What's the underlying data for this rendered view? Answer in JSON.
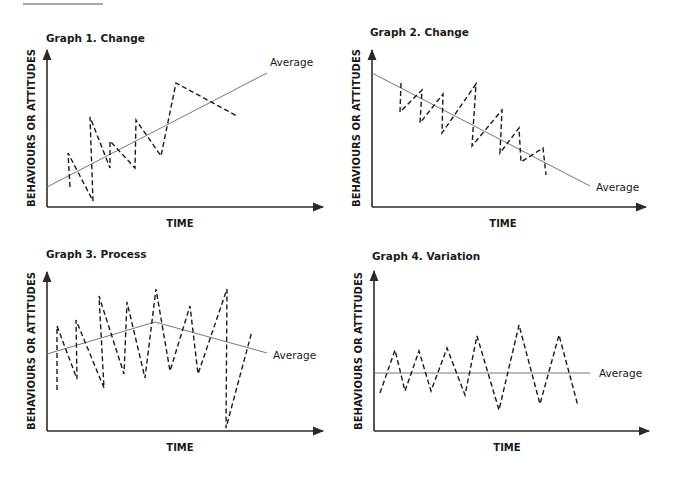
{
  "page": {
    "top_rule": {
      "x1": 23,
      "x2": 103,
      "y": 4
    }
  },
  "common": {
    "y_axis_label": "BEHAVIOURS OR ATTITUDES",
    "x_axis_label": "TIME",
    "average_label": "Average",
    "colors": {
      "axis": "#2a2a2a",
      "average_line": "#777777",
      "data_line": "#1a1a1a"
    }
  },
  "graphs": [
    {
      "title": "Graph 1. Change",
      "title_pos": [
        46,
        42
      ],
      "origin": [
        47,
        207
      ],
      "y_top": 50,
      "x_end": 323,
      "ylabel_pos": [
        35,
        128
      ],
      "xlabel_pos": [
        180,
        227
      ],
      "average_label_pos": [
        270,
        66
      ],
      "average": [
        [
          47,
          187
        ],
        [
          267,
          73
        ]
      ],
      "data": [
        [
          70,
          187
        ],
        [
          68,
          153
        ],
        [
          93,
          201
        ],
        [
          90,
          117
        ],
        [
          110,
          168
        ],
        [
          110,
          141
        ],
        [
          135,
          168
        ],
        [
          136,
          120
        ],
        [
          161,
          156
        ],
        [
          176,
          83
        ],
        [
          237,
          116
        ]
      ]
    },
    {
      "title": "Graph 2. Change",
      "title_pos": [
        370,
        36
      ],
      "origin": [
        372,
        207
      ],
      "y_top": 50,
      "x_end": 646,
      "ylabel_pos": [
        360,
        128
      ],
      "xlabel_pos": [
        503,
        227
      ],
      "average_label_pos": [
        596,
        191
      ],
      "average": [
        [
          372,
          73
        ],
        [
          590,
          186
        ]
      ],
      "data": [
        [
          401,
          83
        ],
        [
          400,
          112
        ],
        [
          422,
          90
        ],
        [
          420,
          123
        ],
        [
          443,
          94
        ],
        [
          442,
          133
        ],
        [
          476,
          84
        ],
        [
          472,
          146
        ],
        [
          502,
          110
        ],
        [
          500,
          153
        ],
        [
          519,
          128
        ],
        [
          521,
          162
        ],
        [
          543,
          148
        ],
        [
          546,
          175
        ]
      ]
    },
    {
      "title": "Graph 3. Process",
      "title_pos": [
        46,
        258
      ],
      "origin": [
        47,
        431
      ],
      "y_top": 272,
      "x_end": 323,
      "ylabel_pos": [
        35,
        351
      ],
      "xlabel_pos": [
        180,
        451
      ],
      "average_label_pos": [
        273,
        359
      ],
      "average": [
        [
          47,
          354
        ],
        [
          155,
          322
        ],
        [
          267,
          353
        ]
      ],
      "data": [
        [
          57,
          390
        ],
        [
          57,
          326
        ],
        [
          77,
          379
        ],
        [
          76,
          320
        ],
        [
          104,
          388
        ],
        [
          99,
          296
        ],
        [
          124,
          374
        ],
        [
          127,
          302
        ],
        [
          145,
          378
        ],
        [
          156,
          289
        ],
        [
          170,
          371
        ],
        [
          190,
          306
        ],
        [
          198,
          374
        ],
        [
          227,
          289
        ],
        [
          226,
          428
        ],
        [
          252,
          331
        ]
      ]
    },
    {
      "title": "Graph 4. Variation",
      "title_pos": [
        372,
        260
      ],
      "origin": [
        374,
        431
      ],
      "y_top": 271,
      "x_end": 649,
      "ylabel_pos": [
        362,
        351
      ],
      "xlabel_pos": [
        507,
        451
      ],
      "average_label_pos": [
        599,
        377
      ],
      "average": [
        [
          374,
          373
        ],
        [
          590,
          373
        ]
      ],
      "data": [
        [
          380,
          393
        ],
        [
          395,
          350
        ],
        [
          405,
          391
        ],
        [
          419,
          351
        ],
        [
          431,
          391
        ],
        [
          447,
          348
        ],
        [
          465,
          395
        ],
        [
          477,
          336
        ],
        [
          499,
          410
        ],
        [
          519,
          325
        ],
        [
          540,
          404
        ],
        [
          559,
          335
        ],
        [
          578,
          406
        ]
      ]
    }
  ],
  "chart_data": [
    {
      "type": "line",
      "title": "Graph 1. Change",
      "xlabel": "TIME",
      "ylabel": "BEHAVIOURS OR ATTITUDES",
      "legend": [
        "Average"
      ],
      "description": "Zig-zag dashed series trending upward around a rising average line",
      "trend": "increasing"
    },
    {
      "type": "line",
      "title": "Graph 2. Change",
      "xlabel": "TIME",
      "ylabel": "BEHAVIOURS OR ATTITUDES",
      "legend": [
        "Average"
      ],
      "description": "Saw-tooth dashed series trending downward around a falling average line",
      "trend": "decreasing"
    },
    {
      "type": "line",
      "title": "Graph 3. Process",
      "xlabel": "TIME",
      "ylabel": "BEHAVIOURS OR ATTITUDES",
      "legend": [
        "Average"
      ],
      "description": "Large oscillations; average rises then falls",
      "trend": "rise-then-fall"
    },
    {
      "type": "line",
      "title": "Graph 4. Variation",
      "xlabel": "TIME",
      "ylabel": "BEHAVIOURS OR ATTITUDES",
      "legend": [
        "Average"
      ],
      "description": "Oscillations of growing amplitude around a flat average",
      "trend": "flat"
    }
  ]
}
